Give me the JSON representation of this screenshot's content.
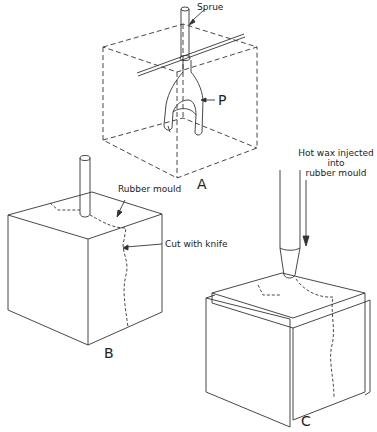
{
  "figure": {
    "panels": [
      {
        "id": "A",
        "label": "A",
        "description": "Pattern with sprue inside dashed mould box"
      },
      {
        "id": "B",
        "label": "B",
        "description": "Rubber mould cut with knife"
      },
      {
        "id": "C",
        "label": "C",
        "description": "Hot wax injected into rubber mould"
      }
    ],
    "annotations": {
      "sprue": "Sprue",
      "pattern": "P",
      "rubber_mould": "Rubber mould",
      "cut_with_knife": "Cut with knife",
      "hot_wax_line1": "Hot wax injected",
      "hot_wax_line2": "into",
      "hot_wax_line3": "rubber mould"
    },
    "colors": {
      "line": "#333333",
      "background": "#ffffff"
    }
  }
}
